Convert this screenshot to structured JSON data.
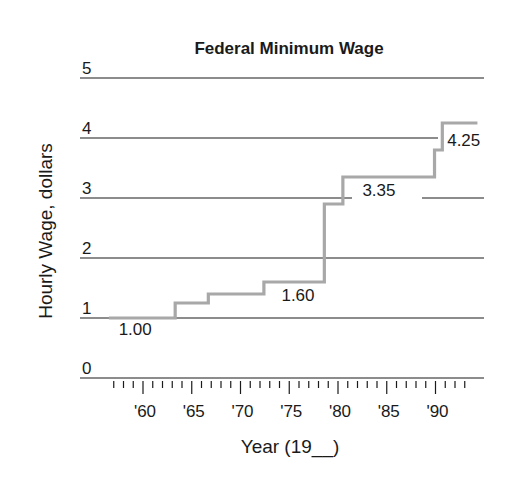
{
  "chart_data": {
    "type": "line",
    "subtype": "step",
    "title": "Federal Minimum Wage",
    "xlabel": "Year (19__)",
    "ylabel": "Hourly Wage, dollars",
    "ylim": [
      0,
      5
    ],
    "xlim": [
      1957,
      1994
    ],
    "y_ticks": [
      "0",
      "1",
      "2",
      "3",
      "4",
      "5"
    ],
    "x_tick_labels": [
      "'60",
      "'65",
      "'70",
      "'75",
      "'80",
      "'85",
      "'90"
    ],
    "x_tick_years": [
      1960,
      1965,
      1970,
      1975,
      1980,
      1985,
      1990
    ],
    "grid": true,
    "legend": null,
    "series": [
      {
        "name": "Federal Minimum Wage",
        "color": "#a8a8a8",
        "points": [
          {
            "x": 1956.5,
            "y": 1.0
          },
          {
            "x": 1963.3,
            "y": 1.25
          },
          {
            "x": 1966.7,
            "y": 1.4
          },
          {
            "x": 1972.4,
            "y": 1.6
          },
          {
            "x": 1978.6,
            "y": 2.9
          },
          {
            "x": 1980.5,
            "y": 3.35
          },
          {
            "x": 1989.9,
            "y": 3.8
          },
          {
            "x": 1990.7,
            "y": 4.25
          },
          {
            "x": 1994.3,
            "y": 4.25
          }
        ]
      }
    ],
    "annotations": [
      {
        "text": "1.00",
        "x": 1957.5,
        "y": 0.72
      },
      {
        "text": "1.60",
        "x": 1974.2,
        "y": 1.28
      },
      {
        "text": "3.35",
        "x": 1982.5,
        "y": 3.03
      },
      {
        "text": "4.25",
        "x": 1991.2,
        "y": 3.87
      }
    ]
  },
  "colors": {
    "grid": "#1a1a1a",
    "series": "#a8a8a8",
    "text": "#1a1a1a"
  }
}
